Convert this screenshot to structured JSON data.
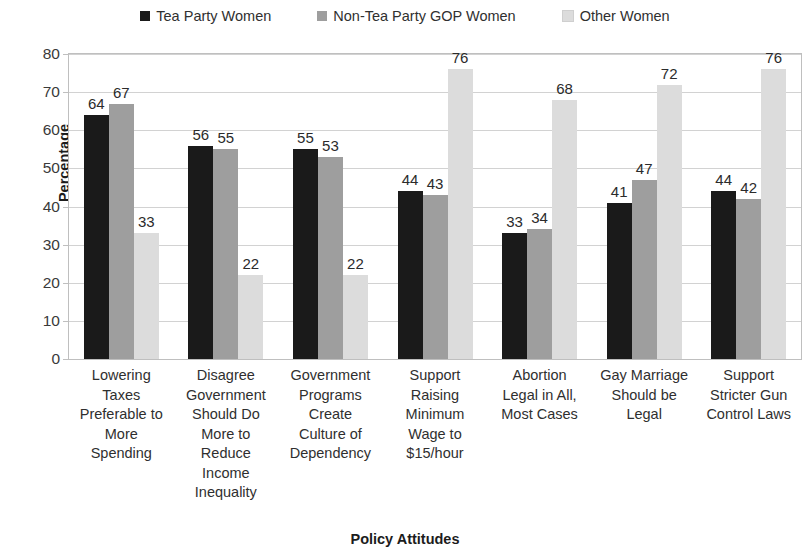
{
  "chart_data": {
    "type": "bar",
    "title": "",
    "xlabel": "Policy Attitudes",
    "ylabel": "Percentage",
    "ylim": [
      0,
      80
    ],
    "ytick_step": 10,
    "yticks": [
      0,
      10,
      20,
      30,
      40,
      50,
      60,
      70,
      80
    ],
    "grid": true,
    "legend_position": "top",
    "data_labels": true,
    "categories": [
      "Lowering Taxes Preferable to More Spending",
      "Disagree Government Should Do More to Reduce Income Inequality",
      "Government Programs Create Culture of Dependency",
      "Support Raising Minimum Wage to $15/hour",
      "Abortion Legal in All, Most Cases",
      "Gay Marriage Should be Legal",
      "Support Stricter Gun Control Laws"
    ],
    "category_lines": [
      [
        "Lowering",
        "Taxes",
        "Preferable to",
        "More",
        "Spending"
      ],
      [
        "Disagree",
        "Government",
        "Should Do",
        "More to",
        "Reduce",
        "Income",
        "Inequality"
      ],
      [
        "Government",
        "Programs",
        "Create",
        "Culture of",
        "Dependency"
      ],
      [
        "Support",
        "Raising",
        "Minimum",
        "Wage to",
        "$15/hour"
      ],
      [
        "Abortion",
        "Legal in All,",
        "Most Cases"
      ],
      [
        "Gay Marriage",
        "Should be",
        "Legal"
      ],
      [
        "Support",
        "Stricter Gun",
        "Control Laws"
      ]
    ],
    "series": [
      {
        "name": "Tea Party Women",
        "color": "#1a1a1a",
        "values": [
          64,
          56,
          55,
          44,
          33,
          41,
          44
        ]
      },
      {
        "name": "Non-Tea Party GOP Women",
        "color": "#9e9e9e",
        "values": [
          67,
          55,
          53,
          43,
          34,
          47,
          42
        ]
      },
      {
        "name": "Other Women",
        "color": "#dcdcdc",
        "values": [
          33,
          22,
          22,
          76,
          68,
          72,
          76
        ]
      }
    ]
  }
}
